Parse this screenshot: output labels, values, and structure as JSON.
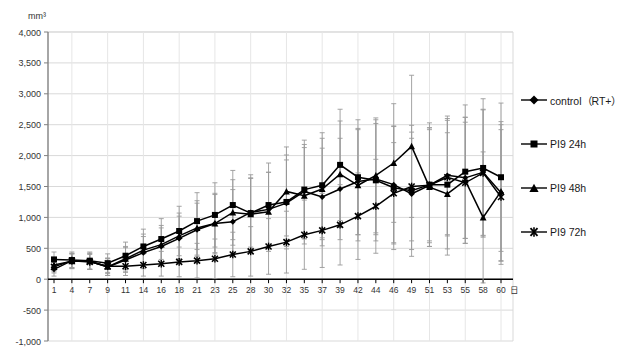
{
  "chart_data": {
    "type": "line",
    "title": "",
    "subtitle": "",
    "xlabel": "日",
    "ylabel": "mm³",
    "y_unit": "mm³",
    "x_unit": "日",
    "grid": true,
    "error_bars": true,
    "legend_position": "right",
    "xlim": [
      0,
      25
    ],
    "ylim": [
      -1000,
      4000
    ],
    "ytick_step": 500,
    "yticks": [
      "4,000",
      "3,500",
      "3,000",
      "2,500",
      "2,000",
      "1,500",
      "1,000",
      "500",
      "0",
      "-500",
      "-1,000"
    ],
    "ytick_values": [
      4000,
      3500,
      3000,
      2500,
      2000,
      1500,
      1000,
      500,
      0,
      -500,
      -1000
    ],
    "categories": [
      "1",
      "4",
      "7",
      "9",
      "11",
      "14",
      "16",
      "18",
      "21",
      "23",
      "25",
      "28",
      "30",
      "32",
      "35",
      "37",
      "39",
      "42",
      "44",
      "46",
      "49",
      "51",
      "53",
      "55",
      "58",
      "60"
    ],
    "x": [
      1,
      4,
      7,
      9,
      11,
      14,
      16,
      18,
      21,
      23,
      25,
      28,
      30,
      32,
      35,
      37,
      39,
      42,
      44,
      46,
      49,
      51,
      53,
      55,
      58,
      60
    ],
    "series": [
      {
        "name": "control（RT+）",
        "marker": "diamond",
        "color": "#000000",
        "values": [
          160,
          300,
          290,
          200,
          310,
          430,
          530,
          660,
          800,
          900,
          930,
          1080,
          1130,
          1230,
          1420,
          1330,
          1460,
          1580,
          1620,
          1530,
          1380,
          1520,
          1680,
          1640,
          1730,
          1400
        ],
        "err_up": [
          110,
          120,
          130,
          140,
          200,
          260,
          300,
          360,
          430,
          470,
          520,
          560,
          600,
          700,
          760,
          790,
          820,
          860,
          900,
          940,
          900,
          930,
          960,
          980,
          1020,
          1100
        ],
        "err_down": [
          110,
          120,
          130,
          140,
          200,
          260,
          300,
          360,
          430,
          470,
          520,
          560,
          600,
          700,
          760,
          790,
          820,
          860,
          900,
          940,
          900,
          930,
          960,
          980,
          1020,
          1100
        ]
      },
      {
        "name": "PI9 24h",
        "marker": "square",
        "color": "#000000",
        "values": [
          320,
          310,
          300,
          260,
          380,
          530,
          650,
          780,
          940,
          1040,
          1200,
          1070,
          1200,
          1250,
          1450,
          1520,
          1850,
          1650,
          1600,
          1480,
          1430,
          1530,
          1530,
          1740,
          1800,
          1650
        ],
        "err_up": [
          120,
          130,
          140,
          150,
          220,
          280,
          330,
          400,
          460,
          520,
          560,
          620,
          680,
          760,
          800,
          850,
          900,
          930,
          980,
          1000,
          1060,
          1000,
          1040,
          1080,
          1120,
          1200
        ],
        "err_down": [
          120,
          130,
          140,
          150,
          220,
          280,
          330,
          400,
          460,
          520,
          560,
          620,
          680,
          760,
          800,
          850,
          900,
          930,
          980,
          1000,
          1060,
          1000,
          1040,
          1080,
          1120,
          1200
        ]
      },
      {
        "name": "PI9 48h",
        "marker": "triangle",
        "color": "#000000",
        "values": [
          230,
          290,
          290,
          200,
          330,
          470,
          560,
          700,
          830,
          900,
          1080,
          1050,
          1090,
          1420,
          1350,
          1460,
          1700,
          1520,
          1680,
          1880,
          2150,
          1490,
          1380,
          1600,
          1000,
          1420
        ],
        "err_up": [
          110,
          120,
          130,
          140,
          200,
          260,
          310,
          370,
          440,
          490,
          530,
          580,
          640,
          720,
          780,
          820,
          860,
          900,
          930,
          960,
          1150,
          960,
          990,
          1020,
          1060,
          1130
        ],
        "err_down": [
          110,
          120,
          130,
          140,
          200,
          260,
          310,
          370,
          440,
          490,
          530,
          580,
          640,
          720,
          780,
          820,
          860,
          900,
          930,
          960,
          1150,
          960,
          990,
          1020,
          1060,
          1130
        ]
      },
      {
        "name": "PI9 72h",
        "marker": "cross",
        "color": "#000000",
        "values": [
          200,
          300,
          280,
          210,
          210,
          230,
          250,
          280,
          300,
          330,
          400,
          450,
          530,
          600,
          720,
          790,
          880,
          1020,
          1180,
          1390,
          1500,
          1520,
          1650,
          1560,
          1720,
          1330
        ],
        "err_up": [
          100,
          110,
          120,
          120,
          150,
          180,
          200,
          240,
          280,
          320,
          360,
          400,
          450,
          500,
          560,
          600,
          650,
          700,
          760,
          820,
          880,
          900,
          950,
          980,
          1020,
          1090
        ],
        "err_down": [
          100,
          110,
          120,
          120,
          150,
          180,
          200,
          240,
          280,
          320,
          360,
          400,
          450,
          500,
          560,
          600,
          650,
          700,
          760,
          820,
          880,
          900,
          950,
          980,
          1020,
          1090
        ]
      }
    ]
  },
  "legend": {
    "items": [
      {
        "label": "control（RT+）",
        "marker": "diamond"
      },
      {
        "label": "PI9 24h",
        "marker": "square"
      },
      {
        "label": "PI9 48h",
        "marker": "triangle"
      },
      {
        "label": "PI9 72h",
        "marker": "cross"
      }
    ]
  },
  "axes": {
    "y_unit_label": "mm³",
    "x_unit_label": "日"
  },
  "colors": {
    "line": "#000000",
    "grid": "#d9d9d9",
    "axis": "#808080",
    "error_bar": "#9a9a9a",
    "text": "#333333",
    "background": "#ffffff"
  }
}
